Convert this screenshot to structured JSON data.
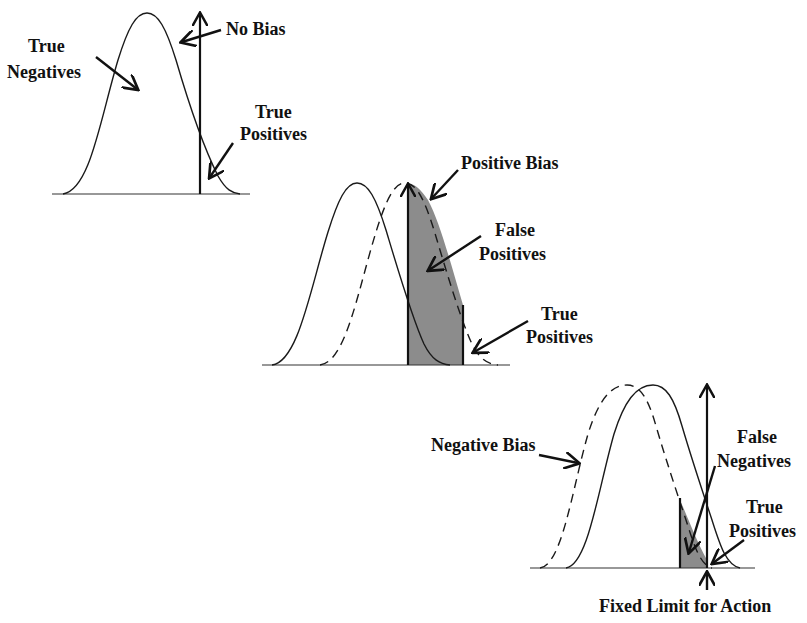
{
  "diagram": {
    "panels": [
      {
        "id": "no-bias",
        "labels": {
          "true_negatives_line1": "True",
          "true_negatives_line2": "Negatives",
          "bias": "No Bias",
          "true_positives_line1": "True",
          "true_positives_line2": "Positives"
        }
      },
      {
        "id": "positive-bias",
        "labels": {
          "bias": "Positive Bias",
          "false_positives_line1": "False",
          "false_positives_line2": "Positives",
          "true_positives_line1": "True",
          "true_positives_line2": "Positives"
        }
      },
      {
        "id": "negative-bias",
        "labels": {
          "bias": "Negative Bias",
          "false_negatives_line1": "False",
          "false_negatives_line2": "Negatives",
          "true_positives_line1": "True",
          "true_positives_line2": "Positives",
          "fixed_limit": "Fixed Limit for Action"
        }
      }
    ],
    "colors": {
      "line": "#1a1a1a",
      "shade": "#8c8c8c",
      "background": "#ffffff"
    }
  }
}
